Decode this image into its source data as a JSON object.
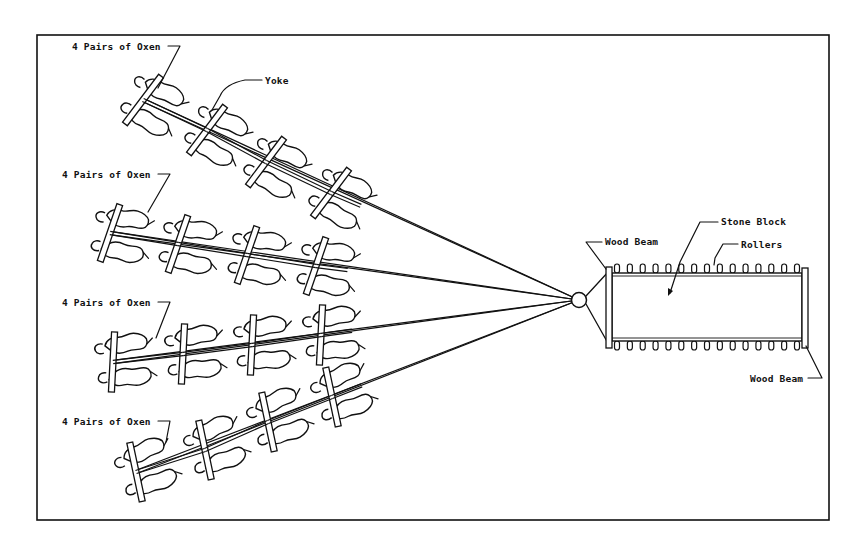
{
  "diagram": {
    "frame": {
      "x": 37,
      "y": 35,
      "width": 792,
      "height": 485,
      "stroke": "#111111"
    },
    "ink_color": "#111111",
    "background": "#ffffff",
    "hitch_point": {
      "x": 579,
      "y": 300,
      "r": 8
    },
    "teams": [
      {
        "label": "4 Pairs of Oxen",
        "label_pos": [
          72,
          50
        ],
        "leader_to": [
          158,
          88
        ],
        "yokes": [
          [
            143,
            100
          ],
          [
            207,
            130
          ],
          [
            266,
            162
          ],
          [
            331,
            193
          ]
        ],
        "angle": 27
      },
      {
        "label": "4 Pairs of Oxen",
        "label_pos": [
          62,
          178
        ],
        "leader_to": [
          148,
          212
        ],
        "yokes": [
          [
            110,
            233
          ],
          [
            178,
            244
          ],
          [
            247,
            255
          ],
          [
            316,
            266
          ]
        ],
        "angle": 9
      },
      {
        "label": "4 Pairs of Oxen",
        "label_pos": [
          62,
          306
        ],
        "leader_to": [
          156,
          338
        ],
        "yokes": [
          [
            113,
            362
          ],
          [
            183,
            354
          ],
          [
            252,
            345
          ],
          [
            321,
            335
          ]
        ],
        "angle": -7
      },
      {
        "label": "4 Pairs of Oxen",
        "label_pos": [
          62,
          425
        ],
        "leader_to": [
          166,
          442
        ],
        "yokes": [
          [
            136,
            472
          ],
          [
            205,
            450
          ],
          [
            268,
            422
          ],
          [
            332,
            397
          ]
        ],
        "angle": -22
      }
    ],
    "labels": {
      "yoke": "Yoke",
      "wood_beam_top": "Wood Beam",
      "stone_block": "Stone Block",
      "rollers": "Rollers",
      "wood_beam_bottom": "Wood Beam"
    },
    "sled": {
      "block": {
        "x": 612,
        "y": 273,
        "width": 190,
        "height": 68
      },
      "front_beam": {
        "x": 607,
        "y": 268,
        "width": 6,
        "height": 80
      },
      "rear_beam": {
        "x": 801,
        "y": 268,
        "width": 6,
        "height": 80
      },
      "roller_count_top": 15,
      "roller_count_bottom": 15
    }
  }
}
